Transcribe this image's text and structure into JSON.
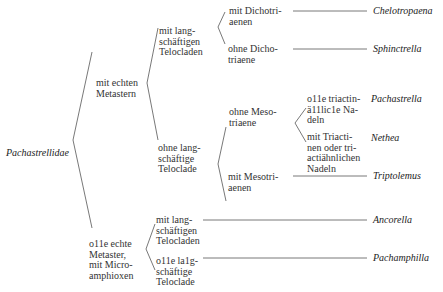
{
  "root": {
    "label": "Pachastrellidae"
  },
  "level1": [
    {
      "label": "mit echten\nMetastern"
    },
    {
      "label": "o11e echte\nMetaster,\nmit Micro-\namphioxen"
    }
  ],
  "level2": [
    {
      "label": "mit lang-\nschäftigen\nTelocladen"
    },
    {
      "label": "ohne lang-\nschäftige\nTeloclade"
    },
    {
      "label": "mit lang-\nschäftigen\nTelocladen"
    },
    {
      "label": "o11e la1g-\nschäftige\nTeloclade"
    }
  ],
  "level3": [
    {
      "label": "mit Dichotri-\naenen"
    },
    {
      "label": "ohne Dicho-\ntriaene"
    },
    {
      "label": "ohne Meso-\ntriaene"
    },
    {
      "label": "mit Mesotri-\naenen"
    }
  ],
  "level4": [
    {
      "label": "o11e triactin-\nä11lic1e Na-\ndeln"
    },
    {
      "label": "mit Triacti-\nnen oder tri-\nactiähnlichen\nNadeln"
    }
  ],
  "taxa": [
    {
      "name": "Chelotropaena"
    },
    {
      "name": "Sphinctrella"
    },
    {
      "name": "Pachastrella"
    },
    {
      "name": "Nethea"
    },
    {
      "name": "Triptolemus"
    },
    {
      "name": "Ancorella"
    },
    {
      "name": "Pachamphilla"
    }
  ]
}
